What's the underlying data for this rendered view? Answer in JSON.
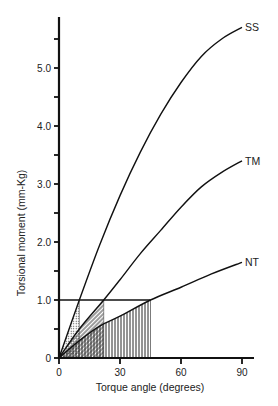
{
  "chart_data": {
    "type": "line",
    "title": "",
    "xlabel": "Torque angle (degrees)",
    "ylabel": "Torsional moment (mm-Kg)",
    "xlim": [
      0,
      90
    ],
    "ylim": [
      0,
      5.7
    ],
    "x_ticks": [
      0,
      30,
      60,
      90
    ],
    "x_tick_labels": [
      "0",
      "30",
      "60",
      "90"
    ],
    "y_ticks": [
      0,
      1.0,
      2.0,
      3.0,
      4.0,
      5.0
    ],
    "y_tick_labels": [
      "0",
      "1.0",
      "2.0",
      "3.0",
      "4.0",
      "5.0"
    ],
    "y_minor_ticks": [
      0.5,
      1.5,
      2.5,
      3.5,
      4.5,
      5.5
    ],
    "grid": false,
    "legend_position": "inline-right",
    "reference_line": {
      "y": 1.0,
      "x_end": 45
    },
    "series": [
      {
        "name": "SS",
        "x": [
          0,
          10,
          20,
          30,
          40,
          50,
          60,
          70,
          80,
          90
        ],
        "values": [
          0,
          1.0,
          1.95,
          2.8,
          3.55,
          4.2,
          4.75,
          5.2,
          5.5,
          5.7
        ]
      },
      {
        "name": "TM",
        "x": [
          0,
          10,
          22,
          30,
          40,
          50,
          60,
          70,
          80,
          90
        ],
        "values": [
          0,
          0.5,
          1.0,
          1.35,
          1.8,
          2.2,
          2.6,
          2.95,
          3.2,
          3.4
        ]
      },
      {
        "name": "NT",
        "x": [
          0,
          10,
          20,
          30,
          45,
          60,
          75,
          90
        ],
        "values": [
          0,
          0.3,
          0.55,
          0.72,
          1.0,
          1.22,
          1.45,
          1.65
        ]
      }
    ],
    "shaded_regions": [
      {
        "series": "SS",
        "x_range": [
          0,
          10
        ],
        "pattern": "dotted"
      },
      {
        "series": "TM",
        "x_range": [
          0,
          22
        ],
        "pattern": "diagonal-hatch"
      },
      {
        "series": "NT",
        "x_range": [
          0,
          45
        ],
        "pattern": "vertical-hatch"
      }
    ]
  }
}
